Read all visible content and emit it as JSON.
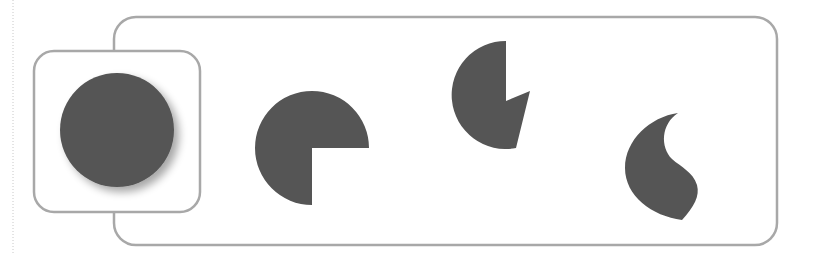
{
  "diagram": {
    "colors": {
      "shape_fill": "#555555",
      "border": "#a8a8a8",
      "background": "#ffffff",
      "guide_line": "#c8c8c8"
    },
    "containers": [
      {
        "name": "outer-panel",
        "shape": "rounded-rect"
      },
      {
        "name": "highlight-box",
        "shape": "rounded-rect"
      }
    ],
    "shapes": [
      {
        "name": "full-circle",
        "type": "circle",
        "shadow": true
      },
      {
        "name": "three-quarter-pie",
        "type": "pie",
        "missing": "bottom-right quadrant"
      },
      {
        "name": "notched-pie",
        "type": "pie",
        "missing": "right wedge with notch"
      },
      {
        "name": "teardrop",
        "type": "comma/teardrop"
      }
    ]
  }
}
